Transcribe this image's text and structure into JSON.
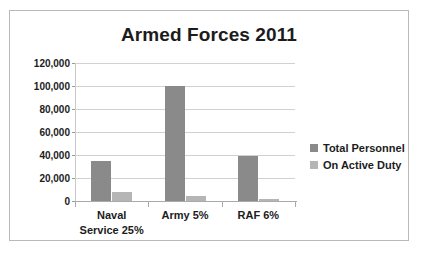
{
  "chart_data": {
    "type": "bar",
    "title": "Armed Forces 2011",
    "xlabel": "",
    "ylabel": "",
    "categories": [
      "Naval Service 25%",
      "Army 5%",
      "RAF 6%"
    ],
    "category_lines": [
      [
        "Naval",
        "Service 25%"
      ],
      [
        "Army 5%"
      ],
      [
        "RAF 6%"
      ]
    ],
    "series": [
      {
        "name": "Total Personnel",
        "values": [
          35000,
          100000,
          39000
        ],
        "color": "#8a8a8a"
      },
      {
        "name": "On Active Duty",
        "values": [
          8000,
          4500,
          1500
        ],
        "color": "#b5b5b5"
      }
    ],
    "ylim": [
      0,
      120000
    ],
    "ytick_values": [
      0,
      20000,
      40000,
      60000,
      80000,
      100000,
      120000
    ],
    "ytick_labels": [
      "0",
      "20,000",
      "40,000",
      "60,000",
      "80,000",
      "100,000",
      "120,000"
    ],
    "grid": true,
    "legend_position": "right"
  }
}
